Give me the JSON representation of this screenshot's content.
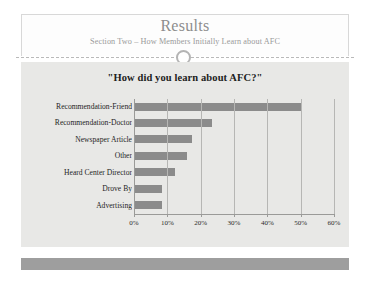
{
  "slide": {
    "title": "Results",
    "subtitle": "Section Two – How Members Initially Learn about AFC"
  },
  "colors": {
    "bar": "#8b8b8b",
    "panel_background": "#e8e8e6",
    "footer": "#9e9e9e",
    "title_text": "#8d8d8d",
    "gridline": "#b6b6b4"
  },
  "chart_data": {
    "type": "bar",
    "orientation": "horizontal",
    "title": "\"How did you learn about AFC?\"",
    "xlabel": "",
    "ylabel": "",
    "categories": [
      "Recommendation-Friend",
      "Recommendation-Doctor",
      "Newspaper Article",
      "Other",
      "Heard Center Director",
      "Drove By",
      "Advertising"
    ],
    "values": [
      50,
      23,
      17,
      15.5,
      12,
      8,
      8
    ],
    "xlim": [
      0,
      60
    ],
    "xticks": [
      0,
      10,
      20,
      30,
      40,
      50,
      60
    ],
    "xtick_labels": [
      "0%",
      "10%",
      "20%",
      "30%",
      "40%",
      "50%",
      "60%"
    ],
    "grid": true,
    "legend": false
  }
}
